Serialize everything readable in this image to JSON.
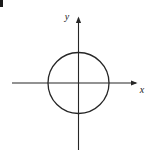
{
  "figure": {
    "kind": "coordinate-plane-diagram",
    "background_color": "#ffffff",
    "stroke_color": "#262626",
    "canvas": {
      "width": 155,
      "height": 156
    }
  },
  "axes": {
    "origin": {
      "x": 78.5,
      "y": 83
    },
    "x_axis": {
      "label": "x",
      "label_position": {
        "x": 141,
        "y": 92
      },
      "start": {
        "x": 12,
        "y": 83
      },
      "end": {
        "x": 137,
        "y": 83
      },
      "arrow_at_end": true,
      "stroke_width": 1.1
    },
    "y_axis": {
      "label": "y",
      "label_position": {
        "x": 67,
        "y": 20
      },
      "start": {
        "x": 78.5,
        "y": 150
      },
      "end": {
        "x": 78.5,
        "y": 17
      },
      "arrow_at_end": true,
      "stroke_width": 1.1
    }
  },
  "shapes": [
    {
      "name": "circle",
      "type": "circle",
      "center": {
        "x": 78.5,
        "y": 83
      },
      "radius": 30.5,
      "stroke_color": "#262626",
      "stroke_width": 1.3,
      "fill": "none"
    }
  ],
  "marks": [
    {
      "name": "corner-artifact",
      "type": "rect",
      "x": 0,
      "y": 0,
      "width": 3,
      "height": 7,
      "color": "#1a1a1a"
    }
  ]
}
